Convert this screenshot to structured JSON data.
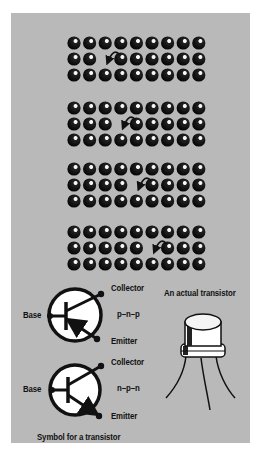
{
  "figure": {
    "background_color": "#b9b9b9",
    "dot_color": "#111111",
    "hole_migration": {
      "grid_columns": 9,
      "grid_rows": 3,
      "grids": [
        {
          "row_with_hole": 1,
          "hole_column": 2,
          "arrow_from_column": 3
        },
        {
          "row_with_hole": 1,
          "hole_column": 3,
          "arrow_from_column": 4
        },
        {
          "row_with_hole": 1,
          "hole_column": 4,
          "arrow_from_column": 5
        },
        {
          "row_with_hole": 1,
          "hole_column": 5,
          "arrow_from_column": 6
        }
      ]
    },
    "pnp_symbol": {
      "type": "p-n-p",
      "labels": {
        "base": "Base",
        "collector": "Collector",
        "emitter": "Emitter",
        "type": "p–n–p"
      }
    },
    "npn_symbol": {
      "type": "n-p-n",
      "labels": {
        "base": "Base",
        "collector": "Collector",
        "emitter": "Emitter",
        "type": "n–p–n"
      }
    },
    "actual_transistor": {
      "caption": "An actual transistor"
    },
    "symbol_caption": "Symbol for a transistor"
  }
}
